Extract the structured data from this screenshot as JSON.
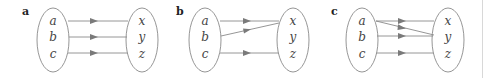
{
  "panels": [
    {
      "label": "a",
      "domain": [
        "a",
        "b",
        "c"
      ],
      "codomain": [
        "x",
        "y",
        "z"
      ],
      "mappings": [
        [
          "a",
          "x"
        ],
        [
          "b",
          "y"
        ],
        [
          "c",
          "z"
        ]
      ]
    },
    {
      "label": "b",
      "domain": [
        "a",
        "b",
        "c"
      ],
      "codomain": [
        "x",
        "y",
        "z"
      ],
      "mappings": [
        [
          "a",
          "x"
        ],
        [
          "b",
          "x"
        ],
        [
          "c",
          "z"
        ]
      ]
    },
    {
      "label": "c",
      "domain": [
        "a",
        "b",
        "c"
      ],
      "codomain": [
        "x",
        "y",
        "z"
      ],
      "mappings": [
        [
          "a",
          "x"
        ],
        [
          "a",
          "y"
        ],
        [
          "b",
          "y"
        ],
        [
          "c",
          "z"
        ]
      ]
    }
  ],
  "colors": {
    "stroke": "#8a8a8a",
    "arrowhead": "#7a7a7a",
    "text": "#444444"
  }
}
